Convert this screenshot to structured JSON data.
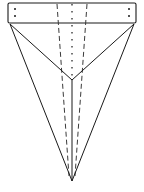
{
  "figure": {
    "type": "technical-line-drawing",
    "canvas": {
      "width": 144,
      "height": 192,
      "background": "#ffffff"
    },
    "colors": {
      "stroke_solid": "#1a1a1a",
      "stroke_dashed": "#3a3a3a",
      "stroke_dotted": "#3a3a3a",
      "fill": "none",
      "dot_marker": "#1a1a1a"
    },
    "stroke_widths": {
      "outline": 1.1,
      "solid": 1.0,
      "dashed": 1.0,
      "dotted": 1.4
    },
    "dash_patterns": {
      "dashed": "5,3",
      "dotted": "1.4,5.6"
    },
    "key_points": {
      "top_bar_left": {
        "x": 8,
        "y": 3
      },
      "top_bar_right": {
        "x": 136,
        "y": 3
      },
      "top_bar_bottom_left": {
        "x": 9,
        "y": 23
      },
      "top_bar_bottom_right": {
        "x": 135,
        "y": 23
      },
      "v_vertex": {
        "x": 72,
        "y": 80
      },
      "bottom_apex": {
        "x": 72,
        "y": 181
      }
    },
    "elements": {
      "top_bar": {
        "name": "top-bar-rectangle",
        "x": 8,
        "y": 3,
        "width": 128,
        "height": 20,
        "corner_radius": 1.5
      },
      "center_dotted_fold": {
        "name": "center-dotted-fold-line",
        "x1": 72,
        "y1": 4,
        "x2": 72,
        "y2": 79
      },
      "center_solid_spine": {
        "name": "center-solid-spine-line",
        "x1": 72,
        "y1": 80,
        "x2": 72,
        "y2": 181
      },
      "dashed_left": {
        "name": "left-dashed-fold-line",
        "x1": 57,
        "y1": 4,
        "x2": 69,
        "y2": 176
      },
      "dashed_right": {
        "name": "right-dashed-fold-line",
        "x1": 87,
        "y1": 4,
        "x2": 75,
        "y2": 176
      },
      "solid_left_inner": {
        "name": "left-inner-solid-edge",
        "x1": 10,
        "y1": 24,
        "x2": 72,
        "y2": 80
      },
      "solid_right_inner": {
        "name": "right-inner-solid-edge",
        "x1": 134,
        "y1": 24,
        "x2": 72,
        "y2": 80
      },
      "solid_left_outer": {
        "name": "left-outer-solid-edge",
        "x1": 10,
        "y1": 24,
        "x2": 72,
        "y2": 181
      },
      "solid_right_outer": {
        "name": "right-outer-solid-edge",
        "x1": 134,
        "y1": 24,
        "x2": 72,
        "y2": 181
      }
    },
    "markers": [
      {
        "name": "dot-top-left-upper",
        "x": 15,
        "y": 9,
        "r": 1.0
      },
      {
        "name": "dot-top-left-lower",
        "x": 15,
        "y": 16,
        "r": 1.0
      },
      {
        "name": "dot-top-right-upper",
        "x": 129,
        "y": 9,
        "r": 1.0
      },
      {
        "name": "dot-top-right-lower",
        "x": 129,
        "y": 16,
        "r": 1.0
      }
    ],
    "labels": []
  }
}
